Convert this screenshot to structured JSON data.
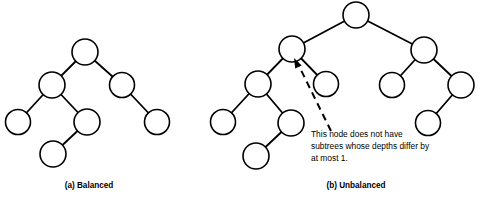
{
  "figure": {
    "background_color": "#ffffff",
    "stroke_color": "#000000",
    "node_fill": "#ffffff"
  },
  "panels": [
    {
      "id": "balanced",
      "caption": "(a) Balanced",
      "caption_x": 89,
      "caption_y": 188,
      "node_radius": 12.5,
      "nodes": [
        {
          "name": "a-root",
          "x": 85,
          "y": 52,
          "r": 13
        },
        {
          "name": "a-left",
          "x": 52,
          "y": 85,
          "r": 13
        },
        {
          "name": "a-right",
          "x": 122,
          "y": 85,
          "r": 12.5
        },
        {
          "name": "a-left-left",
          "x": 18,
          "y": 122,
          "r": 12.5
        },
        {
          "name": "a-left-right",
          "x": 87,
          "y": 122,
          "r": 13
        },
        {
          "name": "a-right-right",
          "x": 157,
          "y": 122,
          "r": 12.5
        },
        {
          "name": "a-deep",
          "x": 53,
          "y": 154,
          "r": 13
        }
      ],
      "edges": [
        {
          "name": "a-edge-root-left",
          "x1": 85,
          "y1": 52,
          "x2": 52,
          "y2": 85
        },
        {
          "name": "a-edge-root-right",
          "x1": 85,
          "y1": 52,
          "x2": 122,
          "y2": 85
        },
        {
          "name": "a-edge-left-leftleft",
          "x1": 52,
          "y1": 85,
          "x2": 18,
          "y2": 122
        },
        {
          "name": "a-edge-left-leftright",
          "x1": 52,
          "y1": 85,
          "x2": 87,
          "y2": 122
        },
        {
          "name": "a-edge-right-rightright",
          "x1": 122,
          "y1": 85,
          "x2": 157,
          "y2": 122
        },
        {
          "name": "a-edge-leftright-deep",
          "x1": 87,
          "y1": 122,
          "x2": 53,
          "y2": 154
        }
      ]
    },
    {
      "id": "unbalanced",
      "caption": "(b) Unbalanced",
      "caption_x": 356,
      "caption_y": 188,
      "node_radius": 12.5,
      "nodes": [
        {
          "name": "b-root",
          "x": 356,
          "y": 15,
          "r": 13
        },
        {
          "name": "b-left",
          "x": 292,
          "y": 49,
          "r": 13
        },
        {
          "name": "b-right",
          "x": 424,
          "y": 50,
          "r": 13
        },
        {
          "name": "b-left-left",
          "x": 258,
          "y": 84,
          "r": 13
        },
        {
          "name": "b-left-right",
          "x": 326,
          "y": 84,
          "r": 12.5
        },
        {
          "name": "b-right-left",
          "x": 392,
          "y": 85,
          "r": 12.5
        },
        {
          "name": "b-right-right",
          "x": 461,
          "y": 85,
          "r": 13
        },
        {
          "name": "b-left-left-left",
          "x": 223,
          "y": 122,
          "r": 12.5
        },
        {
          "name": "b-left-left-right",
          "x": 291,
          "y": 123,
          "r": 13
        },
        {
          "name": "b-right-right-left",
          "x": 428,
          "y": 123,
          "r": 12.5
        },
        {
          "name": "b-deep",
          "x": 256,
          "y": 156,
          "r": 13
        }
      ],
      "edges": [
        {
          "name": "b-edge-root-left",
          "x1": 356,
          "y1": 15,
          "x2": 292,
          "y2": 49
        },
        {
          "name": "b-edge-root-right",
          "x1": 356,
          "y1": 15,
          "x2": 424,
          "y2": 50
        },
        {
          "name": "b-edge-left-ll",
          "x1": 292,
          "y1": 49,
          "x2": 258,
          "y2": 84
        },
        {
          "name": "b-edge-left-lr",
          "x1": 292,
          "y1": 49,
          "x2": 326,
          "y2": 84
        },
        {
          "name": "b-edge-right-rl",
          "x1": 424,
          "y1": 50,
          "x2": 392,
          "y2": 85
        },
        {
          "name": "b-edge-right-rr",
          "x1": 424,
          "y1": 50,
          "x2": 461,
          "y2": 85
        },
        {
          "name": "b-edge-ll-lll",
          "x1": 258,
          "y1": 84,
          "x2": 223,
          "y2": 122
        },
        {
          "name": "b-edge-ll-llr",
          "x1": 258,
          "y1": 84,
          "x2": 291,
          "y2": 123
        },
        {
          "name": "b-edge-rr-rrl",
          "x1": 461,
          "y1": 85,
          "x2": 428,
          "y2": 123
        },
        {
          "name": "b-edge-llr-deep",
          "x1": 291,
          "y1": 123,
          "x2": 256,
          "y2": 156
        }
      ],
      "annotation": {
        "name": "unbalanced-node-callout",
        "lines": [
          "This node does not have",
          "subtrees whose depths differ by",
          "at most 1."
        ],
        "text_x": 311,
        "text_y": 137,
        "line_height": 12,
        "leader": {
          "x1": 331,
          "y1": 131,
          "x2": 297,
          "y2": 62
        },
        "arrow_tip": {
          "x": 294,
          "y": 58
        },
        "arrow_angle_deg": 64
      }
    }
  ]
}
